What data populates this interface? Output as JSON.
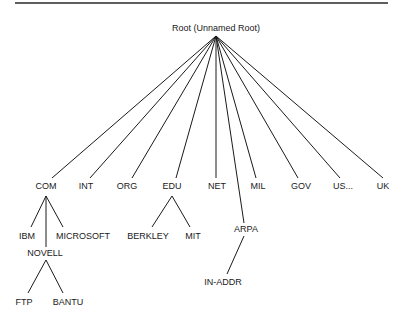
{
  "diagram": {
    "type": "tree",
    "root": {
      "id": "root",
      "label": "Root (Unnamed Root)"
    },
    "nodes": [
      {
        "id": "com",
        "label": "COM",
        "parent": "root"
      },
      {
        "id": "int",
        "label": "INT",
        "parent": "root"
      },
      {
        "id": "org",
        "label": "ORG",
        "parent": "root"
      },
      {
        "id": "edu",
        "label": "EDU",
        "parent": "root"
      },
      {
        "id": "net",
        "label": "NET",
        "parent": "root"
      },
      {
        "id": "arpa",
        "label": "ARPA",
        "parent": "root"
      },
      {
        "id": "mil",
        "label": "MIL",
        "parent": "root"
      },
      {
        "id": "gov",
        "label": "GOV",
        "parent": "root"
      },
      {
        "id": "us",
        "label": "US...",
        "parent": "root"
      },
      {
        "id": "uk",
        "label": "UK",
        "parent": "root"
      },
      {
        "id": "ibm",
        "label": "IBM",
        "parent": "com"
      },
      {
        "id": "novell",
        "label": "NOVELL",
        "parent": "com"
      },
      {
        "id": "microsoft",
        "label": "MICROSOFT",
        "parent": "com"
      },
      {
        "id": "ftp",
        "label": "FTP",
        "parent": "novell"
      },
      {
        "id": "bantu",
        "label": "BANTU",
        "parent": "novell"
      },
      {
        "id": "berkley",
        "label": "BERKLEY",
        "parent": "edu"
      },
      {
        "id": "mit",
        "label": "MIT",
        "parent": "edu"
      },
      {
        "id": "in-addr",
        "label": "IN-ADDR",
        "parent": "arpa"
      }
    ]
  }
}
